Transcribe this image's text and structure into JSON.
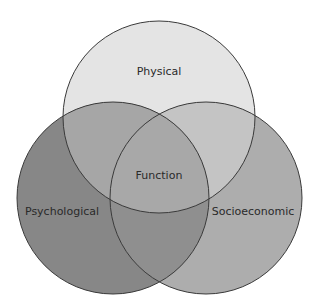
{
  "diagram": {
    "type": "venn",
    "circles": [
      {
        "id": "physical",
        "label": "Physical",
        "color": "#e4e4e4"
      },
      {
        "id": "psychological",
        "label": "Psychological",
        "color": "#868686"
      },
      {
        "id": "socioeconomic",
        "label": "Socioeconomic",
        "color": "#adadad"
      }
    ],
    "center_label": "Function",
    "outline_color": "#3a3a3a"
  }
}
